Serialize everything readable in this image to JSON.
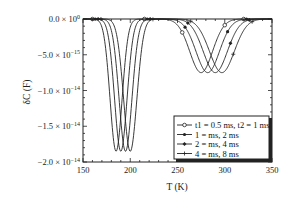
{
  "chart_data": {
    "type": "line",
    "title": "",
    "xlabel": "T (K)",
    "ylabel": "δC (F)",
    "xlim": [
      150,
      350
    ],
    "ylim": [
      -2e-14,
      0
    ],
    "grid": false,
    "legend_position": "lower right",
    "x_ticks": [
      150,
      200,
      250,
      300,
      350
    ],
    "x_tick_labels": [
      "150",
      "200",
      "250",
      "300",
      "350"
    ],
    "y_ticks": [
      0,
      -5e-15,
      -1e-14,
      -1.5e-14,
      -2e-14
    ],
    "y_tick_labels": [
      {
        "mant": "0.0 × 10",
        "exp": "0"
      },
      {
        "mant": "−5.0 × 10",
        "exp": "−15"
      },
      {
        "mant": "−1.0 × 10",
        "exp": "−14"
      },
      {
        "mant": "−1.5 × 10",
        "exp": "−14"
      },
      {
        "mant": "−2.0 × 10",
        "exp": "−14"
      }
    ],
    "series": [
      {
        "name": "t1 = 0.5 ms, t2 = 1 ms",
        "marker": "open-circle",
        "peaks": [
          {
            "center": 185,
            "depth": -1.85e-14,
            "width": 9
          },
          {
            "center": 275,
            "depth": -7.5e-15,
            "width": 17
          }
        ]
      },
      {
        "name": "1 = ms, 2 ms",
        "marker": "filled-circle",
        "peaks": [
          {
            "center": 190,
            "depth": -1.85e-14,
            "width": 9.3
          },
          {
            "center": 282,
            "depth": -7.5e-15,
            "width": 17.5
          }
        ]
      },
      {
        "name": "2 = ms, 4 ms",
        "marker": "filled-diamond",
        "peaks": [
          {
            "center": 195,
            "depth": -1.85e-14,
            "width": 9.6
          },
          {
            "center": 290,
            "depth": -7.5e-15,
            "width": 18
          }
        ]
      },
      {
        "name": "4 = ms, 8 ms",
        "marker": "plus",
        "peaks": [
          {
            "center": 200,
            "depth": -1.85e-14,
            "width": 9.9
          },
          {
            "center": 297,
            "depth": -7.5e-15,
            "width": 18.5
          }
        ]
      }
    ]
  }
}
